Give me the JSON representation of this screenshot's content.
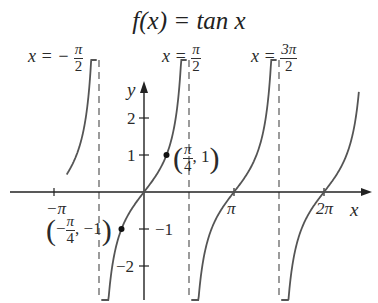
{
  "title": "f(x) = tan x",
  "chart_data": {
    "type": "line",
    "title": "f(x) = tan x",
    "function": "tan x",
    "xlabel": "x",
    "ylabel": "y",
    "x_ticks": [
      {
        "value": -3.14159,
        "label": "−π"
      },
      {
        "value": 3.14159,
        "label": "π"
      },
      {
        "value": 6.28318,
        "label": "2π"
      }
    ],
    "y_ticks": [
      {
        "value": 2,
        "label": "2"
      },
      {
        "value": 1,
        "label": "1"
      },
      {
        "value": -1,
        "label": "−1"
      },
      {
        "value": -2,
        "label": "−2"
      }
    ],
    "asymptotes": [
      {
        "x": -1.5708,
        "label": "x = −π/2",
        "style": "dashed"
      },
      {
        "x": 1.5708,
        "label": "x = π/2",
        "style": "dashed"
      },
      {
        "x": 4.7124,
        "label": "x = 3π/2",
        "style": "dashed"
      }
    ],
    "branches": [
      {
        "x_range": [
          -2.7,
          -1.65
        ]
      },
      {
        "x_range": [
          -1.49,
          1.49
        ]
      },
      {
        "x_range": [
          1.65,
          4.63
        ]
      },
      {
        "x_range": [
          4.79,
          7.5
        ]
      }
    ],
    "points": [
      {
        "x": 0.7854,
        "y": 1,
        "label": "(π/4, 1)"
      },
      {
        "x": -0.7854,
        "y": -1,
        "label": "(−π/4, −1)"
      }
    ],
    "zeros": [
      -3.14159,
      0,
      3.14159,
      6.28318
    ],
    "xlim": [
      -4.8,
      8.0
    ],
    "ylim": [
      -3.0,
      3.2
    ],
    "grid": false,
    "legend": null
  },
  "labels": {
    "asym_left_prefix": "x = −",
    "asym_left_num": "π",
    "asym_left_den": "2",
    "asym_mid_prefix": "x =",
    "asym_mid_num": "π",
    "asym_mid_den": "2",
    "asym_right_prefix": "x =",
    "asym_right_num": "3π",
    "asym_right_den": "2",
    "x_axis": "x",
    "y_axis": "y",
    "tick_neg_pi": "−π",
    "tick_pi": "π",
    "tick_2pi": "2π",
    "tick_y2": "2",
    "tick_y1": "1",
    "tick_ym1": "−1",
    "tick_ym2": "−2",
    "pt1_num": "π",
    "pt1_den": "4",
    "pt1_tail": ", 1",
    "pt2_sign": "−",
    "pt2_num": "π",
    "pt2_den": "4",
    "pt2_tail": ", −1"
  }
}
